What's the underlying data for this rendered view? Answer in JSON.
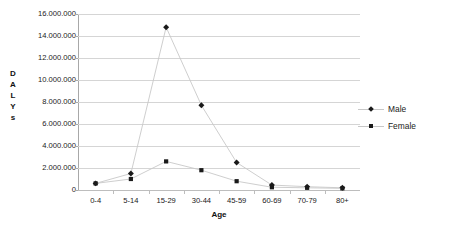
{
  "chart_data": {
    "type": "line",
    "title": "",
    "xlabel": "Age",
    "ylabel": "DALYs",
    "categories": [
      "0-4",
      "5-14",
      "15-29",
      "30-44",
      "45-59",
      "60-69",
      "70-79",
      "80+"
    ],
    "series": [
      {
        "name": "Male",
        "marker": "diamond",
        "color": "#1a1a1a",
        "values": [
          600000,
          1500000,
          14800000,
          7700000,
          2500000,
          450000,
          300000,
          200000
        ]
      },
      {
        "name": "Female",
        "marker": "square",
        "color": "#1a1a1a",
        "values": [
          600000,
          1000000,
          2600000,
          1800000,
          800000,
          250000,
          200000,
          150000
        ]
      }
    ],
    "ylim": [
      0,
      16000000
    ],
    "ytick_values": [
      0,
      2000000,
      4000000,
      6000000,
      8000000,
      10000000,
      12000000,
      14000000,
      16000000
    ],
    "ytick_labels": [
      "0",
      "2.000.000",
      "4.000.000",
      "6.000.000",
      "8.000.000",
      "10.000.000",
      "12.000.000",
      "14.000.000",
      "16.000.000"
    ],
    "grid": true,
    "legend_position": "right",
    "legend_entries": [
      "Male",
      "Female"
    ],
    "gridline_color": "#d5d5d5",
    "axis_color": "#a8a8a8",
    "series_line_color": "#c8c8c8",
    "marker_color": "#1a1a1a",
    "background_color": "#ffffff"
  }
}
